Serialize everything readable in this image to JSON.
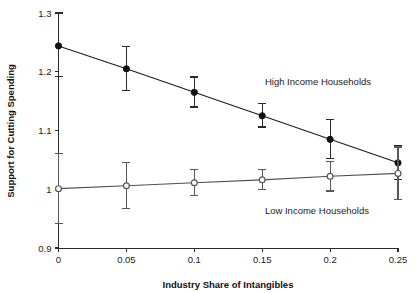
{
  "chart_data": {
    "type": "line",
    "title": "",
    "subtitle": "",
    "xlabel": "Industry Share of Intangibles",
    "ylabel": "Support for Cutting Spending",
    "x": [
      0,
      0.05,
      0.1,
      0.15,
      0.2,
      0.25
    ],
    "xtick_labels": [
      "0",
      "0.05",
      "0.1",
      "0.15",
      "0.2",
      "0.25"
    ],
    "ytick_labels": [
      "1.3",
      "1.2",
      "1.1",
      "1",
      "0.9"
    ],
    "yticks": [
      1.3,
      1.2,
      1.1,
      1.0,
      0.9
    ],
    "xlim": [
      0,
      0.25
    ],
    "ylim": [
      0.9,
      1.3
    ],
    "grid": false,
    "legend_position": "inline-annotation",
    "series": [
      {
        "name": "High Income Households",
        "marker": "filled-circle",
        "color": "#111111",
        "values": [
          1.244,
          1.205,
          1.165,
          1.125,
          1.085,
          1.045
        ],
        "err_low": [
          1.192,
          1.168,
          1.14,
          1.106,
          1.052,
          1.016
        ],
        "err_high": [
          1.3,
          1.243,
          1.191,
          1.146,
          1.118,
          1.075
        ]
      },
      {
        "name": "Low Income Households",
        "marker": "open-circle",
        "color": "#555555",
        "values": [
          1.001,
          1.006,
          1.011,
          1.016,
          1.022,
          1.027
        ],
        "err_low": [
          0.941,
          0.967,
          0.989,
          1.0,
          0.997,
          0.982
        ],
        "err_high": [
          1.061,
          1.046,
          1.033,
          1.033,
          1.048,
          1.072
        ]
      }
    ],
    "annotations": [
      {
        "text": "High Income Households",
        "x": 0.152,
        "y": 1.178
      },
      {
        "text": "Low Income Households",
        "x": 0.152,
        "y": 0.958
      }
    ]
  }
}
